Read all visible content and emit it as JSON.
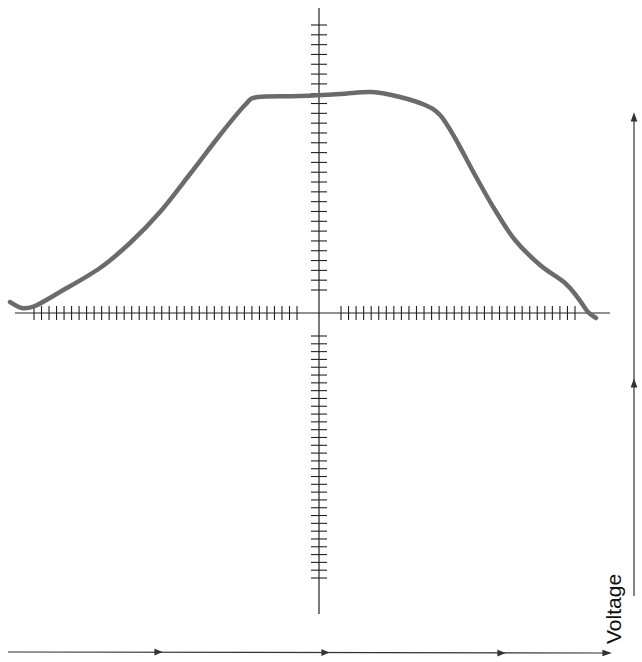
{
  "chart_data": {
    "type": "line",
    "title": "",
    "xlabel": "",
    "ylabel": "Voltage",
    "grid": false,
    "legend": null,
    "axes": {
      "origin_px": [
        319,
        313
      ],
      "x_ticks_left": 36,
      "x_ticks_right": 32,
      "y_ticks_upper": 28,
      "y_ticks_lower": 32
    },
    "series": [
      {
        "name": "pulse",
        "color": "#6b6b6b",
        "points_px": [
          [
            10,
            302
          ],
          [
            22,
            308
          ],
          [
            35,
            306
          ],
          [
            60,
            292
          ],
          [
            100,
            268
          ],
          [
            130,
            243
          ],
          [
            160,
            212
          ],
          [
            190,
            174
          ],
          [
            220,
            135
          ],
          [
            245,
            105
          ],
          [
            258,
            97
          ],
          [
            300,
            96
          ],
          [
            340,
            94
          ],
          [
            372,
            92
          ],
          [
            400,
            97
          ],
          [
            425,
            105
          ],
          [
            440,
            115
          ],
          [
            455,
            138
          ],
          [
            475,
            175
          ],
          [
            495,
            210
          ],
          [
            515,
            240
          ],
          [
            540,
            265
          ],
          [
            565,
            283
          ],
          [
            578,
            298
          ],
          [
            588,
            312
          ],
          [
            596,
            318
          ]
        ]
      }
    ]
  },
  "labels": {
    "voltage_axis": "Voltage"
  },
  "colors": {
    "curve": "#6b6b6b",
    "axis": "#222222",
    "background": "#ffffff"
  }
}
